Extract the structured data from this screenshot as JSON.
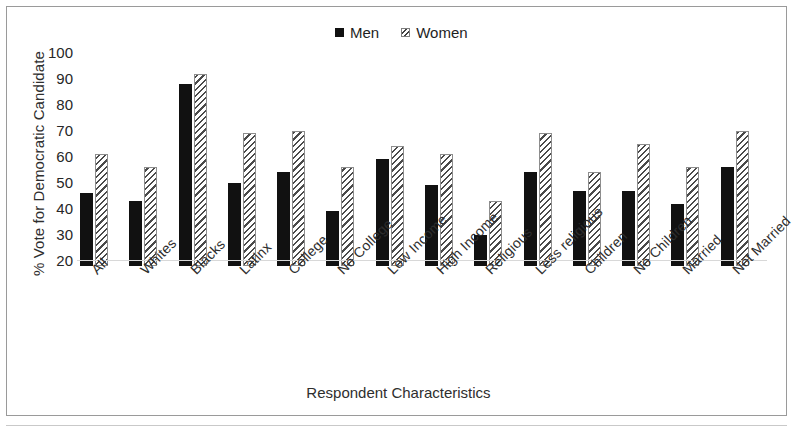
{
  "figure": {
    "background_color": "#ffffff",
    "frame_color": "#9a9a9a"
  },
  "legend": {
    "position": "top-center",
    "items": [
      {
        "label": "Men",
        "marker": "filled-square-marker",
        "color": "#111111"
      },
      {
        "label": "Women",
        "marker": "hatched-square-marker",
        "color": "#4a4a4a"
      }
    ]
  },
  "chart_data": {
    "type": "bar",
    "title": "",
    "xlabel": "Respondent Characteristics",
    "ylabel": "% Vote for Democratic Candidate",
    "ylim": [
      20,
      100
    ],
    "yticks": [
      100,
      90,
      80,
      70,
      60,
      50,
      40,
      30,
      20
    ],
    "grid": false,
    "legend_position": "top-center",
    "categories": [
      "All",
      "Whites",
      "Blacks",
      "Latinx",
      "College",
      "No College",
      "Low Income",
      "High Income",
      "Religious",
      "Less religious",
      "Children",
      "No Children",
      "Married",
      "Not Married"
    ],
    "series": [
      {
        "name": "Men",
        "color": "#111111",
        "values": [
          48,
          45,
          90,
          52,
          56,
          41,
          61,
          51,
          32,
          56,
          49,
          49,
          44,
          58
        ]
      },
      {
        "name": "Women",
        "color": "#4a4a4a",
        "values": [
          63,
          58,
          94,
          71,
          72,
          58,
          66,
          63,
          45,
          71,
          56,
          67,
          58,
          72
        ]
      }
    ]
  }
}
